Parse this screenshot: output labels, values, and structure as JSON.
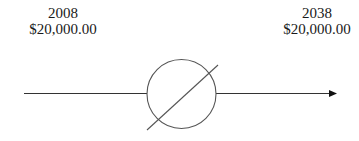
{
  "diagram": {
    "type": "cash-flow-timeline",
    "start": {
      "year": "2008",
      "amount": "$20,000.00"
    },
    "end": {
      "year": "2038",
      "amount": "$20,000.00"
    },
    "symbol": "circle-with-slash",
    "colors": {
      "line": "#333333",
      "circle": "#555555",
      "text": "#1a1a1a",
      "background": "#ffffff"
    }
  }
}
